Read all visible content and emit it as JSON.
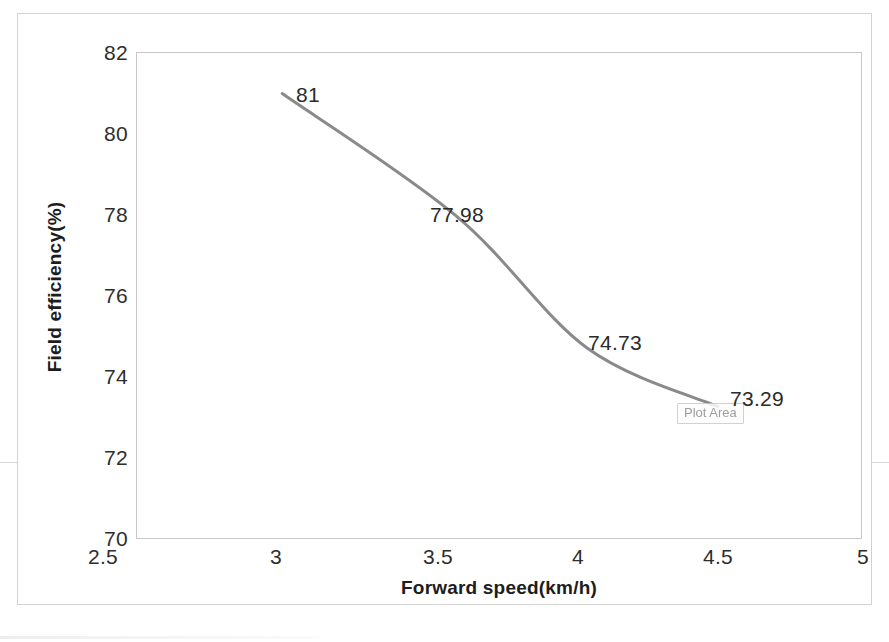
{
  "chart_data": {
    "type": "line",
    "title": "",
    "xlabel": "Forward speed(km/h)",
    "ylabel": "Field efficiency(%)",
    "xlim": [
      2.5,
      5
    ],
    "ylim": [
      70,
      82
    ],
    "grid": false,
    "legend": null,
    "smooth": true,
    "line_color": "#8a8a8a",
    "line_width": 3,
    "x": [
      3,
      3.6,
      4.05,
      4.5
    ],
    "y": [
      81,
      77.98,
      74.73,
      73.29
    ],
    "point_labels": [
      "81",
      "77.98",
      "74.73",
      "73.29"
    ],
    "xticks": [
      "2.5",
      "3",
      "3.5",
      "4",
      "4.5",
      "5"
    ],
    "xtick_values": [
      2.5,
      3,
      3.5,
      4,
      4.5,
      5
    ],
    "yticks": [
      "82",
      "80",
      "78",
      "76",
      "74",
      "72",
      "70"
    ],
    "ytick_values": [
      82,
      80,
      78,
      76,
      74,
      72,
      70
    ],
    "series": [
      {
        "name": "Field efficiency",
        "x": [
          3,
          3.6,
          4.05,
          4.5
        ],
        "values": [
          81,
          77.98,
          74.73,
          73.29
        ]
      }
    ]
  },
  "axis": {
    "y_title": "Field efficiency(%)",
    "x_title": "Forward speed(km/h)",
    "y_ticks": [
      {
        "label": "82",
        "top": 28
      },
      {
        "label": "80",
        "top": 109
      },
      {
        "label": "78",
        "top": 190
      },
      {
        "label": "76",
        "top": 271
      },
      {
        "label": "74",
        "top": 352
      },
      {
        "label": "72",
        "top": 433
      },
      {
        "label": "70",
        "top": 514
      }
    ],
    "x_ticks": [
      {
        "label": "2.5",
        "left": 85
      },
      {
        "label": "3",
        "left": 258
      },
      {
        "label": "3.5",
        "left": 420
      },
      {
        "label": "4",
        "left": 560
      },
      {
        "label": "4.5",
        "left": 700
      },
      {
        "label": "5",
        "left": 845
      }
    ]
  },
  "data_labels": [
    {
      "text": "81",
      "left": 278,
      "top": 70
    },
    {
      "text": "77.98",
      "left": 412,
      "top": 190
    },
    {
      "text": "74.73",
      "left": 570,
      "top": 318
    },
    {
      "text": "73.29",
      "left": 712,
      "top": 374
    }
  ],
  "tooltip": {
    "label": "Plot Area"
  }
}
